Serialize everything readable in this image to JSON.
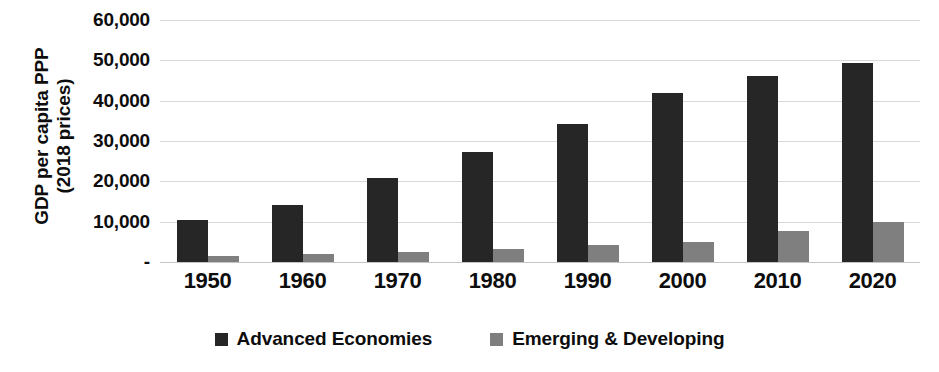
{
  "chart_data": {
    "type": "bar",
    "title": "",
    "subtitle": "",
    "xlabel": "",
    "ylabel": "GDP per capita PPP (2018 prices)",
    "ylabel_lines": [
      "GDP per capita PPP",
      "(2018 prices)"
    ],
    "categories": [
      "1950",
      "1960",
      "1970",
      "1980",
      "1990",
      "2000",
      "2010",
      "2020"
    ],
    "series": [
      {
        "name": "Advanced Economies",
        "color": "#262626",
        "values": [
          10500,
          14200,
          20800,
          27400,
          34200,
          42000,
          46200,
          49400
        ]
      },
      {
        "name": "Emerging & Developing",
        "color": "#7f7f7f",
        "values": [
          1500,
          1900,
          2500,
          3300,
          4300,
          5000,
          7600,
          9800
        ]
      }
    ],
    "ylim": [
      0,
      60000
    ],
    "ytick_values": [
      0,
      10000,
      20000,
      30000,
      40000,
      50000,
      60000
    ],
    "ytick_labels": [
      "-",
      "10,000",
      "20,000",
      "30,000",
      "40,000",
      "50,000",
      "60,000"
    ],
    "grid": true,
    "grid_axis": "y",
    "grid_color": "#d9d9d9",
    "legend": true,
    "legend_position": "bottom",
    "legend_entries": [
      "Advanced Economies",
      "Emerging & Developing"
    ],
    "background": "#ffffff"
  }
}
